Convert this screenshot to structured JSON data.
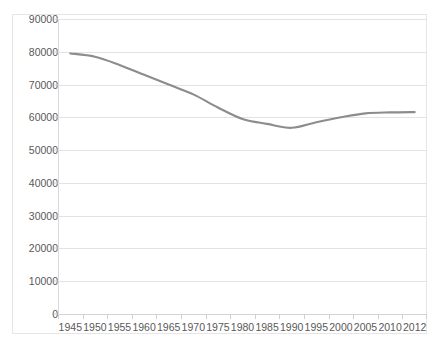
{
  "top_remnant": {
    "ghost_text": "· · ·   ·   · ·"
  },
  "chart_data": {
    "type": "line",
    "title": "",
    "subtitle": "",
    "xlabel": "",
    "ylabel": "",
    "categories": [
      "1945",
      "1950",
      "1955",
      "1960",
      "1965",
      "1970",
      "1975",
      "1980",
      "1985",
      "1990",
      "1995",
      "2000",
      "2005",
      "2010",
      "2012"
    ],
    "values": [
      79500,
      78500,
      76000,
      73000,
      70000,
      67000,
      63000,
      59500,
      58000,
      56800,
      58500,
      60000,
      61200,
      61500,
      61600
    ],
    "series": [
      {
        "name": "",
        "values": [
          79500,
          78500,
          76000,
          73000,
          70000,
          67000,
          63000,
          59500,
          58000,
          56800,
          58500,
          60000,
          61200,
          61500,
          61600
        ],
        "color": "#8c8c8c"
      }
    ],
    "ylim": [
      0,
      90000
    ],
    "yticks": [
      0,
      10000,
      20000,
      30000,
      40000,
      50000,
      60000,
      70000,
      80000,
      90000
    ],
    "ytick_labels": [
      "0",
      "10000",
      "20000",
      "30000",
      "40000",
      "50000",
      "60000",
      "70000",
      "80000",
      "90000"
    ],
    "grid": true,
    "grid_axis": "y",
    "legend": false,
    "legend_position": "none",
    "smoothed": true,
    "markers": false,
    "annotations": []
  },
  "style": {
    "line_color": "#8c8c8c",
    "grid_color": "#e2e2e4",
    "axis_color": "#d5d5d7",
    "tick_label_color": "#595959",
    "frame_color": "#e6e6e6",
    "plot_background": "#ffffff"
  }
}
